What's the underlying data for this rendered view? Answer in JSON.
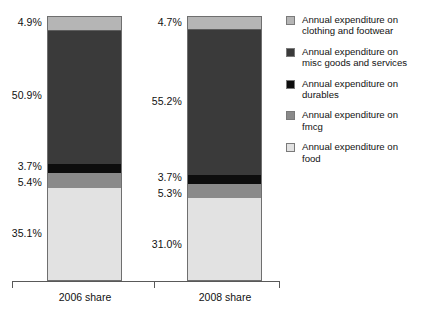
{
  "chart_data": {
    "type": "bar",
    "subtype": "stacked-bar-100pct",
    "title": "",
    "subtitle": "",
    "xlabel": "",
    "ylabel": "",
    "ylim": [
      0,
      100
    ],
    "grid": false,
    "legend_position": "right",
    "orientation": "vertical",
    "stack_order_bottom_to_top": [
      "food",
      "fmcg",
      "durables",
      "misc",
      "clothing"
    ],
    "categories": [
      "2006 share",
      "2008 share"
    ],
    "series": [
      {
        "name": "Annual expenditure on food",
        "key": "food",
        "color": "#e2e2e2",
        "values": [
          35.1,
          31.0
        ],
        "labels": [
          "35.1%",
          "31.0%"
        ]
      },
      {
        "name": "Annual expenditure on fmcg",
        "key": "fmcg",
        "color": "#8a8a8a",
        "values": [
          5.4,
          5.3
        ],
        "labels": [
          "5.4%",
          "5.3%"
        ]
      },
      {
        "name": "Annual expenditure on durables",
        "key": "durables",
        "color": "#0d0d0d",
        "values": [
          3.7,
          3.7
        ],
        "labels": [
          "3.7%",
          "3.7%"
        ]
      },
      {
        "name": "Annual expenditure on misc goods and services",
        "key": "misc",
        "color": "#3a3a3a",
        "values": [
          50.9,
          55.2
        ],
        "labels": [
          "50.9%",
          "55.2%"
        ]
      },
      {
        "name": "Annual expenditure on clothing and footwear",
        "key": "clothing",
        "color": "#b5b5b5",
        "values": [
          4.9,
          4.7
        ],
        "labels": [
          "4.9%",
          "4.7%"
        ]
      }
    ]
  },
  "bars": [
    {
      "category": "2006 share",
      "segments": {
        "clothing": "4.9%",
        "misc": "50.9%",
        "durables": "3.7%",
        "fmcg": "5.4%",
        "food": "35.1%"
      }
    },
    {
      "category": "2008 share",
      "segments": {
        "clothing": "4.7%",
        "misc": "55.2%",
        "durables": "3.7%",
        "fmcg": "5.3%",
        "food": "31.0%"
      }
    }
  ],
  "axis": {
    "category_labels": [
      "2006 share",
      "2008 share"
    ]
  },
  "legend": {
    "items": [
      {
        "color": "#b5b5b5",
        "line1": "Annual expenditure on",
        "line2": "clothing and footwear",
        "key": "clothing"
      },
      {
        "color": "#3a3a3a",
        "line1": "Annual expenditure on",
        "line2": "misc goods and services",
        "key": "misc"
      },
      {
        "color": "#0d0d0d",
        "line1": "Annual expenditure on",
        "line2": "durables",
        "key": "durables"
      },
      {
        "color": "#8a8a8a",
        "line1": "Annual expenditure on",
        "line2": "fmcg",
        "key": "fmcg"
      },
      {
        "color": "#e2e2e2",
        "line1": "Annual expenditure on",
        "line2": "food",
        "key": "food"
      }
    ]
  }
}
